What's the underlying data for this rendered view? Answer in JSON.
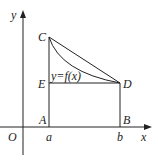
{
  "diagram": {
    "axes": {
      "x_label": "x",
      "y_label": "y",
      "origin_label": "O"
    },
    "points": {
      "A": "A",
      "B": "B",
      "C": "C",
      "D": "D",
      "E": "E"
    },
    "ticks": {
      "a": "a",
      "b": "b"
    },
    "curve_label": "y=f(x)",
    "colors": {
      "stroke": "#222222",
      "background": "#ffffff"
    }
  }
}
